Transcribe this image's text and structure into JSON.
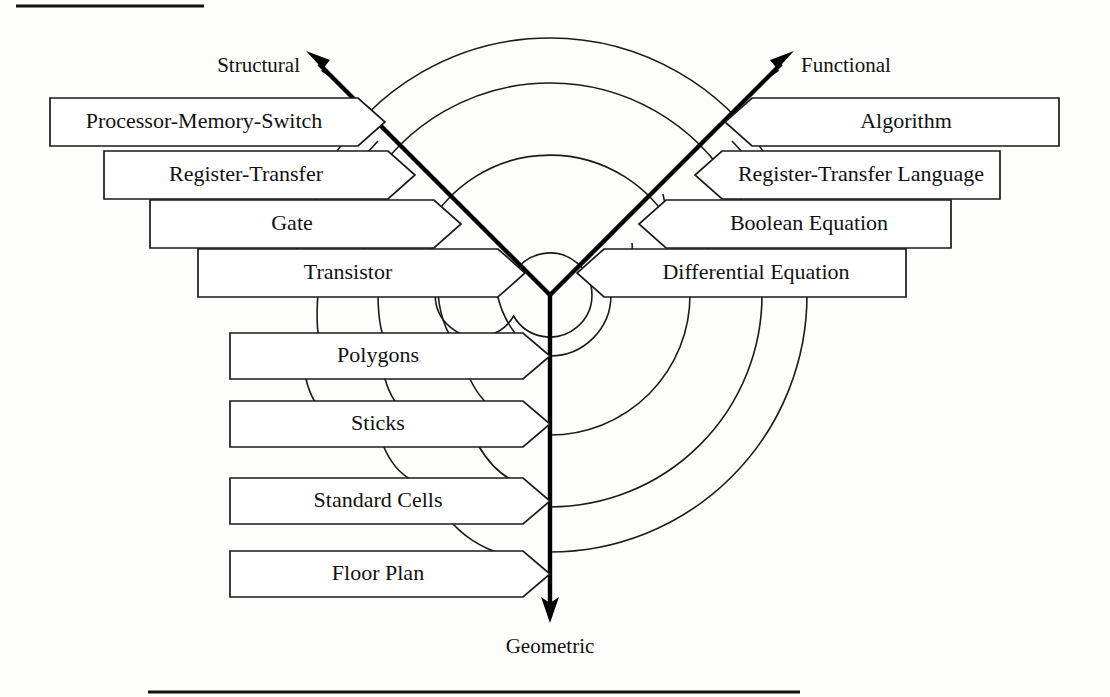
{
  "figure": {
    "background_color": "#fdfdfc",
    "line_color": "#1a1a1a",
    "axis_color": "#000000"
  },
  "axes": [
    {
      "id": "structural",
      "label": "Structural",
      "direction": "upper-left"
    },
    {
      "id": "functional",
      "label": "Functional",
      "direction": "upper-right"
    },
    {
      "id": "geometric",
      "label": "Geometric",
      "direction": "down"
    }
  ],
  "structural_domain": {
    "axis_label": "Structural",
    "levels": [
      {
        "label": "Processor-Memory-Switch",
        "abstraction": 1
      },
      {
        "label": "Register-Transfer",
        "abstraction": 2
      },
      {
        "label": "Gate",
        "abstraction": 3
      },
      {
        "label": "Transistor",
        "abstraction": 4
      }
    ]
  },
  "functional_domain": {
    "axis_label": "Functional",
    "levels": [
      {
        "label": "Algorithm",
        "abstraction": 1
      },
      {
        "label": "Register-Transfer Language",
        "abstraction": 2
      },
      {
        "label": "Boolean Equation",
        "abstraction": 3
      },
      {
        "label": "Differential Equation",
        "abstraction": 4
      }
    ]
  },
  "geometric_domain": {
    "axis_label": "Geometric",
    "levels": [
      {
        "label": "Polygons",
        "abstraction": 4
      },
      {
        "label": "Sticks",
        "abstraction": 3
      },
      {
        "label": "Standard Cells",
        "abstraction": 2
      },
      {
        "label": "Floor Plan",
        "abstraction": 1
      }
    ]
  },
  "rings": {
    "count": 4,
    "note": "concentric abstraction-level arcs centred on the Y origin"
  },
  "labels": {
    "structural": "Structural",
    "functional": "Functional",
    "geometric": "Geometric",
    "s1": "Processor-Memory-Switch",
    "s2": "Register-Transfer",
    "s3": "Gate",
    "s4": "Transistor",
    "f1": "Algorithm",
    "f2": "Register-Transfer Language",
    "f3": "Boolean Equation",
    "f4": "Differential Equation",
    "g1": "Polygons",
    "g2": "Sticks",
    "g3": "Standard Cells",
    "g4": "Floor Plan"
  }
}
